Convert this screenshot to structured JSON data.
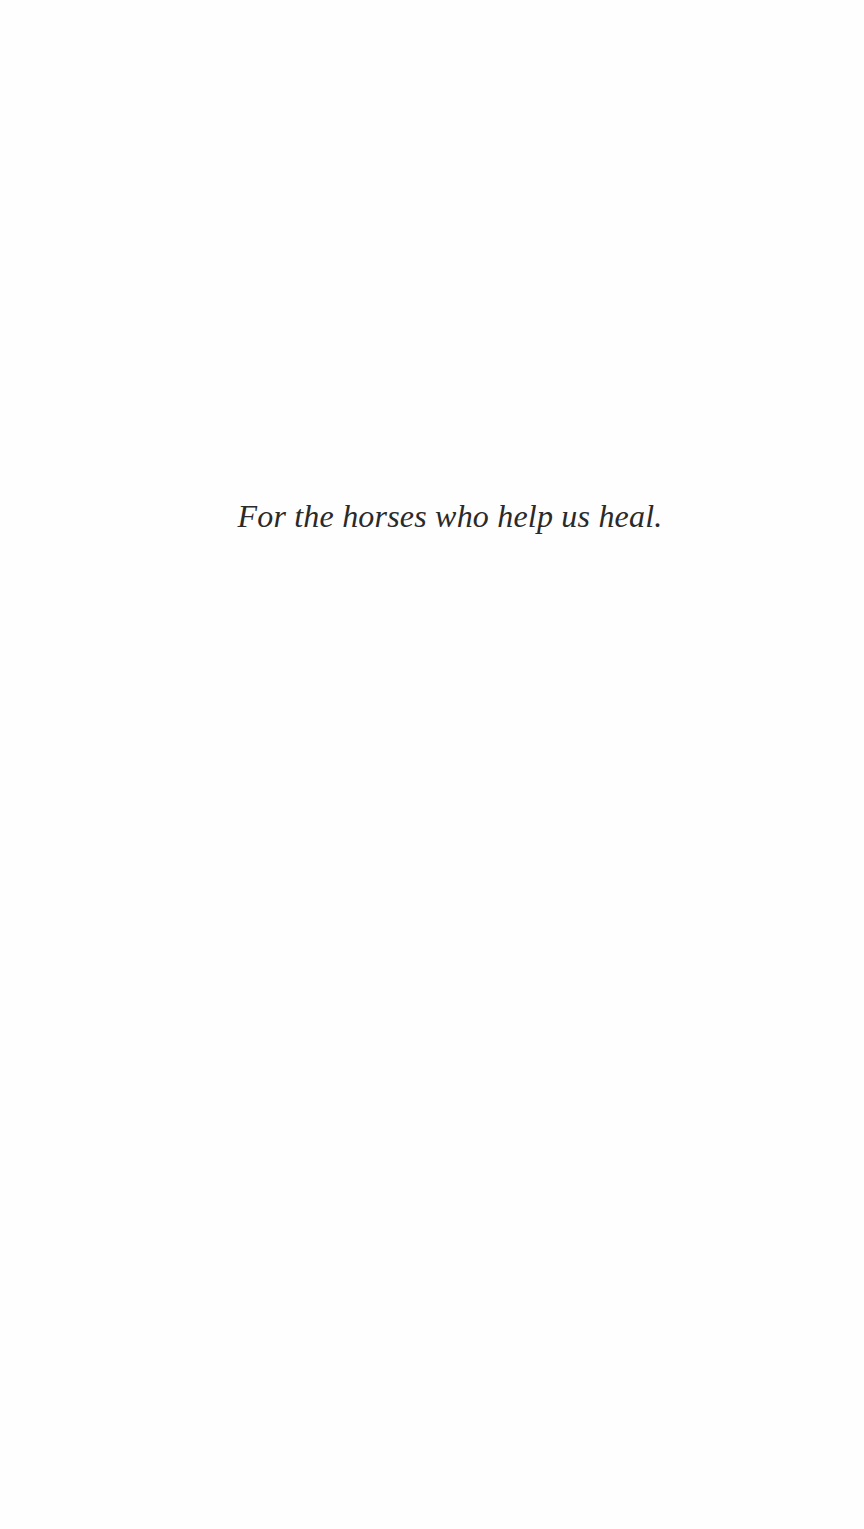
{
  "page": {
    "type": "dedication",
    "background": "#ffffff",
    "text_color": "#2a2a2a"
  },
  "dedication": {
    "text": "For the horses who help us heal."
  }
}
